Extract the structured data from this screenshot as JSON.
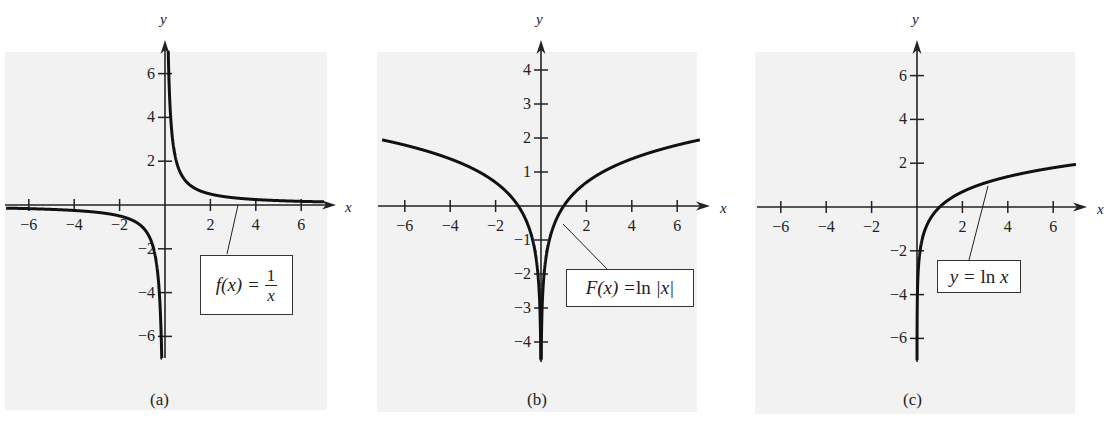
{
  "colors": {
    "background": "#ffffff",
    "plot_bg": "#f2f2f2",
    "curve": "#111111",
    "axis": "#222222"
  },
  "panels": [
    {
      "id": "a",
      "caption": "(a)",
      "label_parts": {
        "lhs": "f(x) = ",
        "num": "1",
        "den": "x"
      }
    },
    {
      "id": "b",
      "caption": "(b)",
      "label_parts": {
        "lhs": "F(x) = ",
        "fn": "ln",
        "rhs": " |x|"
      }
    },
    {
      "id": "c",
      "caption": "(c)",
      "label_parts": {
        "lhs": "y = ",
        "fn": "ln",
        "rhs": " x"
      }
    }
  ],
  "chart_data": [
    {
      "type": "line",
      "title": "f(x) = 1/x",
      "caption": "(a)",
      "xlabel": "x",
      "ylabel": "y",
      "xlim": [
        -7,
        7
      ],
      "ylim": [
        -7,
        7
      ],
      "x_ticks": [
        -6,
        -4,
        -2,
        2,
        4,
        6
      ],
      "y_ticks": [
        -6,
        -4,
        -2,
        2,
        4,
        6
      ],
      "grid": false,
      "series": [
        {
          "name": "f(x) = 1/x",
          "function": "1/x",
          "x": [
            -7,
            -6,
            -4,
            -2,
            -1,
            -0.5,
            -0.2,
            -0.15,
            0.15,
            0.2,
            0.5,
            1,
            2,
            4,
            6,
            7
          ],
          "y": [
            -0.14,
            -0.17,
            -0.25,
            -0.5,
            -1,
            -2,
            -5,
            -6.7,
            6.7,
            5,
            2,
            1,
            0.5,
            0.25,
            0.17,
            0.14
          ]
        }
      ],
      "annotation": {
        "text": "f(x) = 1/x",
        "points_to_x": 3.2
      }
    },
    {
      "type": "line",
      "title": "F(x) = ln |x|",
      "caption": "(b)",
      "xlabel": "x",
      "ylabel": "y",
      "xlim": [
        -7,
        7
      ],
      "ylim": [
        -4.5,
        4.5
      ],
      "x_ticks": [
        -6,
        -4,
        -2,
        2,
        4,
        6
      ],
      "y_ticks": [
        -4,
        -3,
        -2,
        -1,
        1,
        2,
        3,
        4
      ],
      "grid": false,
      "series": [
        {
          "name": "F(x) = ln |x|",
          "function": "ln|x|",
          "x": [
            -7,
            -6,
            -4,
            -2,
            -1,
            -0.5,
            -0.1,
            -0.015,
            0.015,
            0.1,
            0.5,
            1,
            2,
            4,
            6,
            7
          ],
          "y": [
            1.95,
            1.79,
            1.39,
            0.69,
            0,
            -0.69,
            -2.3,
            -4.2,
            -4.2,
            -2.3,
            -0.69,
            0,
            0.69,
            1.39,
            1.79,
            1.95
          ]
        }
      ],
      "annotation": {
        "text": "F(x) = ln |x|",
        "points_to_x": 0.9
      }
    },
    {
      "type": "line",
      "title": "y = ln x",
      "caption": "(c)",
      "xlabel": "x",
      "ylabel": "y",
      "xlim": [
        -7,
        7
      ],
      "ylim": [
        -7,
        7
      ],
      "x_ticks": [
        -6,
        -4,
        -2,
        2,
        4,
        6
      ],
      "y_ticks": [
        -6,
        -4,
        -2,
        2,
        4,
        6
      ],
      "grid": false,
      "series": [
        {
          "name": "y = ln x",
          "function": "ln x",
          "x": [
            0.0025,
            0.01,
            0.1,
            0.5,
            1,
            2,
            4,
            6,
            7
          ],
          "y": [
            -6,
            -4.6,
            -2.3,
            -0.69,
            0,
            0.69,
            1.39,
            1.79,
            1.95
          ]
        }
      ],
      "annotation": {
        "text": "y = ln x",
        "points_to_x": 3.1
      }
    }
  ],
  "layout": [
    {
      "left": 0,
      "bg": [
        5,
        52,
        322,
        358
      ],
      "origin": [
        165,
        205
      ],
      "ux": 22.7,
      "uy": 21.9,
      "ymin": -7,
      "ymax": 7,
      "yaxis_top": 40,
      "yaxis_bottom": 358,
      "xaxis_left": 5,
      "xaxis_right": 336,
      "box": [
        200,
        255,
        93,
        60
      ],
      "leader": [
        227,
        254,
        238,
        205
      ],
      "caption_pos": [
        150,
        390
      ],
      "ylabel_pos": [
        160,
        24
      ],
      "xlabel_pos": [
        345,
        212
      ]
    },
    {
      "left": 370,
      "bg": [
        7,
        52,
        320,
        360
      ],
      "origin": [
        171,
        206
      ],
      "ux": 22.7,
      "uy": 34,
      "ymin": -4.5,
      "ymax": 4.5,
      "yaxis_top": 40,
      "yaxis_bottom": 362,
      "xaxis_left": 8,
      "xaxis_right": 340,
      "box": [
        196,
        269,
        128,
        38
      ],
      "leader": [
        237,
        269,
        193,
        224
      ],
      "caption_pos": [
        157,
        390
      ],
      "ylabel_pos": [
        166,
        24
      ],
      "xlabel_pos": [
        350,
        213
      ]
    },
    {
      "left": 745,
      "bg": [
        10,
        52,
        320,
        362
      ],
      "origin": [
        172,
        207
      ],
      "ux": 22.7,
      "uy": 21.9,
      "ymin": -7,
      "ymax": 7,
      "yaxis_top": 40,
      "yaxis_bottom": 362,
      "xaxis_left": 12,
      "xaxis_right": 342,
      "box": [
        192,
        260,
        84,
        33
      ],
      "leader": [
        224,
        260,
        243,
        186
      ],
      "caption_pos": [
        158,
        390
      ],
      "ylabel_pos": [
        167,
        24
      ],
      "xlabel_pos": [
        352,
        214
      ]
    }
  ]
}
